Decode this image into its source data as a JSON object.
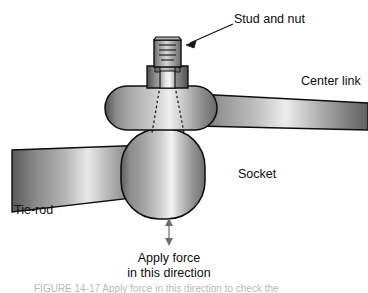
{
  "figure": {
    "type": "technical-illustration",
    "background_color": "#ffffff",
    "outline_color": "#0d0d0d"
  },
  "labels": {
    "stud_and_nut": "Stud and nut",
    "center_link": "Center link",
    "socket": "Socket",
    "tie_rod": "Tie-rod",
    "apply_force_line1": "Apply force",
    "apply_force_line2": "in this direction"
  },
  "annotations": {
    "stud_pointer": "leader-arrow-to-stud",
    "force_arrow": "double-headed-vertical-arrow",
    "hidden_edges": "dashed-taper-lines"
  },
  "parts": [
    {
      "id": "stud-and-nut",
      "name": "Stud and nut",
      "description": "Threaded stud with hex nut at top of assembly"
    },
    {
      "id": "center-link",
      "name": "Center link",
      "description": "Horizontal pill-shaped body with tapered arm extending right"
    },
    {
      "id": "socket",
      "name": "Socket",
      "description": "Large rounded-rectangle housing below the center link"
    },
    {
      "id": "tie-rod",
      "name": "Tie-rod",
      "description": "Tapered bar extending down and to the left from the socket"
    }
  ],
  "colors": {
    "metal_light": "#f2f2f2",
    "metal_mid": "#9a9a9a",
    "metal_dark": "#4a4a4a",
    "metal_shadow": "#2e2e2e",
    "outline": "#0d0d0d",
    "text": "#0d0d0d",
    "caption": "#b9b9b9"
  },
  "bottom_caption": "FIGURE 14-17   Apply force in this direction to check the"
}
